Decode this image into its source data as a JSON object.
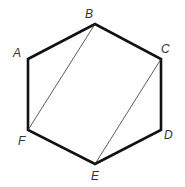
{
  "diagram": {
    "type": "hexagon",
    "vertices": [
      {
        "name": "A",
        "x": 28,
        "y": 59,
        "label_x": 13,
        "label_y": 57
      },
      {
        "name": "B",
        "x": 95,
        "y": 24,
        "label_x": 85,
        "label_y": 18
      },
      {
        "name": "C",
        "x": 161,
        "y": 59,
        "label_x": 161,
        "label_y": 53
      },
      {
        "name": "D",
        "x": 161,
        "y": 130,
        "label_x": 164,
        "label_y": 139
      },
      {
        "name": "E",
        "x": 95,
        "y": 164,
        "label_x": 91,
        "label_y": 180
      },
      {
        "name": "F",
        "x": 28,
        "y": 130,
        "label_x": 18,
        "label_y": 145
      }
    ],
    "diagonals": [
      [
        "B",
        "F"
      ],
      [
        "C",
        "E"
      ]
    ],
    "colors": {
      "edge": "#111111",
      "diagonal": "#333333",
      "label": "#333333"
    }
  }
}
